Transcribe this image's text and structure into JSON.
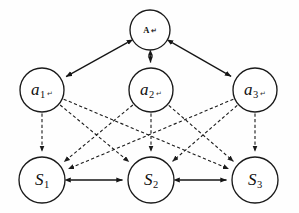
{
  "diagram": {
    "type": "node-link-graph",
    "canvas": {
      "width": 299,
      "height": 213,
      "background": "#fefefe"
    },
    "style": {
      "node_stroke": "#1a1a1a",
      "node_fill": "#ffffff",
      "solid_edge_color": "#151515",
      "dashed_edge_color": "#1b1b1b",
      "dash_pattern": "3.2 2.4"
    },
    "layers": [
      {
        "name": "coordinator",
        "y": 30
      },
      {
        "name": "agents",
        "y": 90
      },
      {
        "name": "states",
        "y": 180
      }
    ],
    "nodes": [
      {
        "id": "A",
        "label": "A",
        "subscript": "",
        "mark": "↵",
        "layer": "coordinator",
        "cx": 150,
        "cy": 30,
        "r": 20,
        "label_style": "root-label"
      },
      {
        "id": "a1",
        "label": "a",
        "subscript": "1",
        "mark": "↵",
        "layer": "agents",
        "cx": 42,
        "cy": 90,
        "r": 22,
        "label_style": "agent-label"
      },
      {
        "id": "a2",
        "label": "a",
        "subscript": "2",
        "mark": "↵",
        "layer": "agents",
        "cx": 151,
        "cy": 90,
        "r": 22,
        "label_style": "agent-label"
      },
      {
        "id": "a3",
        "label": "a",
        "subscript": "3",
        "mark": "↵",
        "layer": "agents",
        "cx": 255,
        "cy": 90,
        "r": 22,
        "label_style": "agent-label"
      },
      {
        "id": "S1",
        "label": "S",
        "subscript": "1",
        "mark": "",
        "layer": "states",
        "cx": 42,
        "cy": 180,
        "r": 23,
        "label_style": "state-label"
      },
      {
        "id": "S2",
        "label": "S",
        "subscript": "2",
        "mark": "",
        "layer": "states",
        "cx": 151,
        "cy": 180,
        "r": 23,
        "label_style": "state-label"
      },
      {
        "id": "S3",
        "label": "S",
        "subscript": "3",
        "mark": "",
        "layer": "states",
        "cx": 255,
        "cy": 180,
        "r": 23,
        "label_style": "state-label"
      }
    ],
    "edges": [
      {
        "id": "e-A-a1",
        "from": "A",
        "to": "a1",
        "style": "solid",
        "arrow": "both"
      },
      {
        "id": "e-A-a2",
        "from": "A",
        "to": "a2",
        "style": "solid",
        "arrow": "both"
      },
      {
        "id": "e-A-a3",
        "from": "A",
        "to": "a3",
        "style": "solid",
        "arrow": "both"
      },
      {
        "id": "e-a1-S1",
        "from": "a1",
        "to": "S1",
        "style": "dashed",
        "arrow": "end"
      },
      {
        "id": "e-a1-S2",
        "from": "a1",
        "to": "S2",
        "style": "dashed",
        "arrow": "end"
      },
      {
        "id": "e-a1-S3",
        "from": "a1",
        "to": "S3",
        "style": "dashed",
        "arrow": "end"
      },
      {
        "id": "e-a2-S1",
        "from": "a2",
        "to": "S1",
        "style": "dashed",
        "arrow": "end"
      },
      {
        "id": "e-a2-S2",
        "from": "a2",
        "to": "S2",
        "style": "dashed",
        "arrow": "end"
      },
      {
        "id": "e-a2-S3",
        "from": "a2",
        "to": "S3",
        "style": "dashed",
        "arrow": "end"
      },
      {
        "id": "e-a3-S1",
        "from": "a3",
        "to": "S1",
        "style": "dashed",
        "arrow": "end"
      },
      {
        "id": "e-a3-S2",
        "from": "a3",
        "to": "S2",
        "style": "dashed",
        "arrow": "end"
      },
      {
        "id": "e-a3-S3",
        "from": "a3",
        "to": "S3",
        "style": "dashed",
        "arrow": "end"
      },
      {
        "id": "e-S1-S2",
        "from": "S1",
        "to": "S2",
        "style": "solid",
        "arrow": "both"
      },
      {
        "id": "e-S2-S3",
        "from": "S2",
        "to": "S3",
        "style": "solid",
        "arrow": "both"
      }
    ]
  }
}
